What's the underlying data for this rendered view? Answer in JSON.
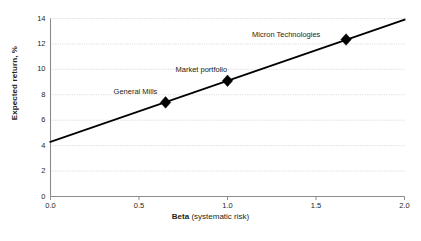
{
  "chart_data": {
    "type": "line",
    "title": "",
    "subtitle": "",
    "xlabel_bold": "Beta",
    "xlabel_rest": " (systematic risk)",
    "ylabel": "Expected return, %",
    "xlim": [
      0.0,
      2.0
    ],
    "ylim": [
      0,
      14
    ],
    "grid": "horizontal-dotted",
    "legend": "none",
    "x_ticks": [
      "0.0",
      "0.5",
      "1.0",
      "1.5",
      "2.0"
    ],
    "x_tick_values": [
      0.0,
      0.5,
      1.0,
      1.5,
      2.0
    ],
    "y_ticks": [
      "0",
      "2",
      "4",
      "6",
      "8",
      "10",
      "12",
      "14"
    ],
    "y_tick_values": [
      0,
      2,
      4,
      6,
      8,
      10,
      12,
      14
    ],
    "series": [
      {
        "name": "Security market line",
        "type": "line",
        "x": [
          0.0,
          2.0
        ],
        "values": [
          4.3,
          13.9
        ],
        "color": "#000000"
      }
    ],
    "points": [
      {
        "label": "General Mills",
        "x": 0.65,
        "y": 7.4,
        "marker": "diamond",
        "label_dx": -52,
        "label_dy": -15
      },
      {
        "label": "Market portfolio",
        "x": 1.0,
        "y": 9.1,
        "marker": "diamond",
        "label_dx": -52,
        "label_dy": -16
      },
      {
        "label": "Micron Technologies",
        "x": 1.67,
        "y": 12.35,
        "marker": "diamond",
        "label_dx": -94,
        "label_dy": -9
      }
    ],
    "colors": {
      "line": "#000000",
      "marker": "#000000",
      "axis": "#8c8c8c",
      "grid": "#c9c9c9",
      "text": "#231f20",
      "background": "#ffffff"
    }
  }
}
